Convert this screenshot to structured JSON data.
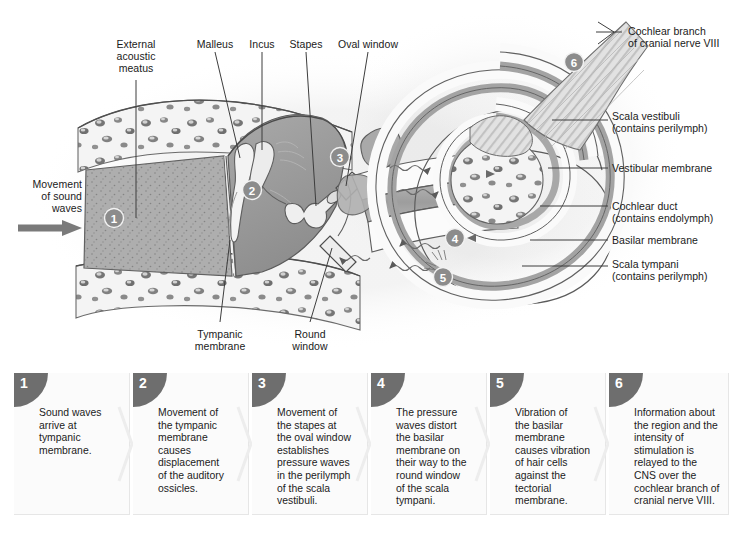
{
  "diagram": {
    "labels": [
      {
        "name": "external-acoustic-meatus",
        "text": "External\nacoustic\nmeatus",
        "align": "center",
        "x": 103,
        "y": 38,
        "w": 66
      },
      {
        "name": "malleus",
        "text": "Malleus",
        "align": "center",
        "x": 191,
        "y": 38,
        "w": 48
      },
      {
        "name": "incus",
        "text": "Incus",
        "align": "center",
        "x": 243,
        "y": 38,
        "w": 38
      },
      {
        "name": "stapes",
        "text": "Stapes",
        "align": "center",
        "x": 284,
        "y": 38,
        "w": 44
      },
      {
        "name": "oval-window",
        "text": "Oval window",
        "align": "center",
        "x": 331,
        "y": 38,
        "w": 74
      },
      {
        "name": "movement-of-sound-waves",
        "text": "Movement\nof sound\nwaves",
        "align": "right",
        "x": 16,
        "y": 178,
        "w": 66
      },
      {
        "name": "tympanic-membrane",
        "text": "Tympanic\nmembrane",
        "align": "center",
        "x": 187,
        "y": 328,
        "w": 66
      },
      {
        "name": "round-window",
        "text": "Round\nwindow",
        "align": "center",
        "x": 283,
        "y": 328,
        "w": 54
      },
      {
        "name": "cochlear-branch-of-cranial-nerve-viii",
        "text": "Cochlear branch\nof cranial nerve VIII",
        "align": "left",
        "x": 628,
        "y": 25,
        "w": 106
      },
      {
        "name": "scala-vestibuli",
        "text": "Scala vestibuli\n(contains perilymph)",
        "align": "left",
        "x": 612,
        "y": 110,
        "w": 116
      },
      {
        "name": "vestibular-membrane",
        "text": "Vestibular membrane",
        "align": "left",
        "x": 612,
        "y": 162,
        "w": 120
      },
      {
        "name": "cochlear-duct",
        "text": "Cochlear duct\n(contains endolymph)",
        "align": "left",
        "x": 612,
        "y": 200,
        "w": 120
      },
      {
        "name": "basilar-membrane",
        "text": "Basilar membrane",
        "align": "left",
        "x": 612,
        "y": 236,
        "w": 116
      },
      {
        "name": "scala-tympani",
        "text": "Scala tympani\n(contains perilymph)",
        "align": "left",
        "x": 612,
        "y": 259,
        "w": 116
      }
    ],
    "markers": [
      {
        "name": "marker-1",
        "label": "1",
        "x": 114,
        "y": 218
      },
      {
        "name": "marker-2",
        "label": "2",
        "x": 252,
        "y": 190
      },
      {
        "name": "marker-3",
        "label": "3",
        "x": 337,
        "y": 157
      },
      {
        "name": "marker-4",
        "label": "4",
        "x": 455,
        "y": 238
      },
      {
        "name": "marker-5",
        "label": "5",
        "x": 443,
        "y": 277
      },
      {
        "name": "marker-6",
        "label": "6",
        "x": 574,
        "y": 62
      }
    ],
    "colors": {
      "bone": "#f2f2f2",
      "marrow_cavity": "#d9d9d9",
      "middle_ear": "#9b9b9b",
      "ear_canal": "#adadad",
      "cochlear_duct": "#a8a8a8",
      "scala": "#fafafa",
      "outline": "#4d4d4d",
      "marker_fill": "#8c8c8c",
      "nerve": "#dcdcdc"
    }
  },
  "steps": [
    {
      "name": "step-1",
      "number": "1",
      "text": "Sound waves\narrive at\ntympanic\nmembrane.",
      "x": 14
    },
    {
      "name": "step-2",
      "number": "2",
      "text": "Movement of\nthe tympanic\nmembrane causes\ndisplacement\nof the auditory\nossicles.",
      "x": 133
    },
    {
      "name": "step-3",
      "number": "3",
      "text": "Movement of\nthe stapes at\nthe oval window\nestablishes\npressure waves\nin the perilymph\nof the scala\nvestibuli.",
      "x": 252
    },
    {
      "name": "step-4",
      "number": "4",
      "text": "The pressure\nwaves distort\nthe basilar\nmembrane on\ntheir way to the\nround window\nof the scala\ntympani.",
      "x": 371
    },
    {
      "name": "step-5",
      "number": "5",
      "text": "Vibration of\nthe basilar\nmembrane\ncauses vibration\nof hair cells\nagainst  the\ntectorial\nmembrane.",
      "x": 490
    },
    {
      "name": "step-6",
      "number": "6",
      "text": "Information about\nthe region and the\nintensity of\nstimulation is\nrelayed to the\nCNS over the\ncochlear branch of\ncranial nerve VIII.",
      "x": 609
    }
  ]
}
